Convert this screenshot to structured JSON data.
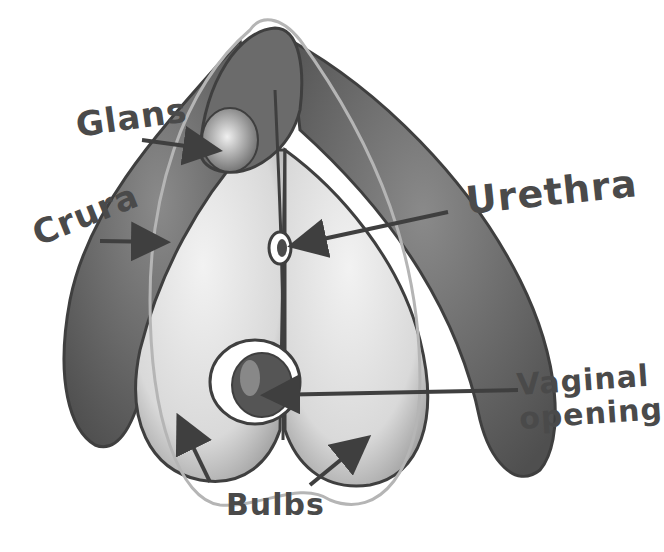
{
  "diagram": {
    "style": "grayscale watercolor with hand-lettered labels",
    "colors": {
      "ink": "#3f3f3f",
      "label": "#4a4a4a",
      "dark_fill": "#5e5e5e",
      "mid_fill": "#8a8a8a",
      "light_fill": "#e6e6e6",
      "outline_light": "#b5b5b5",
      "background": "#ffffff"
    },
    "labels": [
      {
        "id": "glans",
        "text": "Glans"
      },
      {
        "id": "crura",
        "text": "Crura"
      },
      {
        "id": "urethra",
        "text": "Urethra"
      },
      {
        "id": "vaginal_opening",
        "text": "Vaginal opening",
        "lines": [
          "Vaginal",
          "opening"
        ]
      },
      {
        "id": "bulbs",
        "text": "Bulbs"
      }
    ]
  }
}
